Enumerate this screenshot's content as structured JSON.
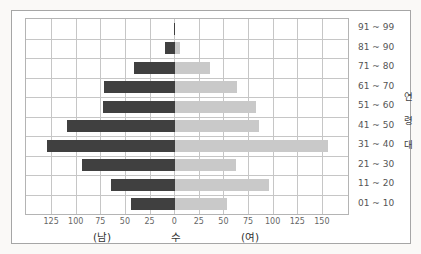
{
  "chart_data": {
    "type": "bar",
    "variant": "population-pyramid",
    "orientation": "horizontal",
    "title": "",
    "categories_top_to_bottom": [
      "91 ~ 99",
      "81 ~ 90",
      "71 ~ 80",
      "61 ~ 70",
      "51 ~ 60",
      "41 ~ 50",
      "31 ~ 40",
      "21 ~ 30",
      "11 ~ 20",
      "01 ~ 10"
    ],
    "series": [
      {
        "name": "남",
        "side": "left",
        "color": "#404040",
        "values": [
          1,
          10,
          42,
          72,
          73,
          110,
          130,
          95,
          65,
          45
        ]
      },
      {
        "name": "여",
        "side": "right",
        "color": "#c9c9c9",
        "values": [
          0,
          5,
          35,
          63,
          82,
          85,
          155,
          62,
          95,
          53
        ]
      }
    ],
    "x_tick_labels": [
      "125",
      "100",
      "75",
      "50",
      "25",
      "0",
      "25",
      "50",
      "75",
      "100",
      "125",
      "150"
    ],
    "x_tick_units": [
      -125,
      -100,
      -75,
      -50,
      -25,
      0,
      25,
      50,
      75,
      100,
      125,
      150
    ],
    "axis": {
      "xmin": -151.5,
      "xmax": 175.5,
      "grid": true,
      "grid_color": "#c6c6c6"
    },
    "xlabel_left": "(남)",
    "xlabel_center": "수",
    "xlabel_right": "(여)",
    "ylabel": "연령대",
    "ylabel_chars": [
      "연",
      "령",
      "대"
    ],
    "colors": {
      "male_bar": "#404040",
      "female_bar": "#c9c9c9"
    }
  }
}
